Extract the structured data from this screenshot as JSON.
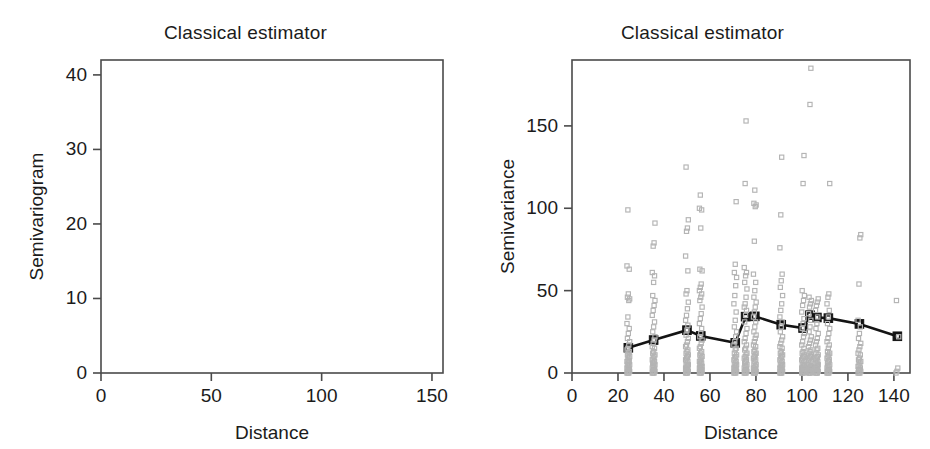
{
  "figure": {
    "background_color": "#ffffff",
    "foreground_color": "#1b1b1b",
    "cloud_color": "#b4b4b4",
    "mean_color": "#141414",
    "axis_color": "#4a4a4a"
  },
  "panels": {
    "left": {
      "title": "Classical estimator",
      "xlabel": "Distance",
      "ylabel": "Semivariogram",
      "xticks": [
        "0",
        "50",
        "100",
        "150"
      ],
      "yticks": [
        "40",
        "30",
        "20",
        "10",
        "0"
      ]
    },
    "right": {
      "title": "Classical estimator",
      "xlabel": "Distance",
      "ylabel": "Semivariance",
      "xticks": [
        "0",
        "20",
        "40",
        "60",
        "80",
        "100",
        "120",
        "140"
      ],
      "yticks": [
        "150",
        "100",
        "50",
        "0"
      ]
    }
  },
  "chart_data": [
    {
      "id": "left-panel",
      "type": "scatter",
      "title": "Classical estimator",
      "xlabel": "Distance",
      "ylabel": "Semivariogram",
      "xlim": [
        0,
        155
      ],
      "ylim": [
        0,
        42
      ],
      "xticks": [
        0,
        50,
        100,
        150
      ],
      "yticks": [
        0,
        10,
        20,
        30,
        40
      ],
      "grid": false,
      "legend": "none",
      "marker": "open-circle",
      "series": [
        {
          "name": "Classical semivariogram estimate",
          "points": [
            {
              "x": 24.5,
              "y": 15.1
            },
            {
              "x": 35.5,
              "y": 19.6
            },
            {
              "x": 50.0,
              "y": 25.8
            },
            {
              "x": 56.0,
              "y": 22.1
            },
            {
              "x": 71.0,
              "y": 18.6
            },
            {
              "x": 75.5,
              "y": 34.0
            },
            {
              "x": 79.5,
              "y": 34.0
            },
            {
              "x": 91.0,
              "y": 29.5
            },
            {
              "x": 100.5,
              "y": 27.1
            },
            {
              "x": 103.5,
              "y": 34.8
            },
            {
              "x": 106.5,
              "y": 33.8
            },
            {
              "x": 111.5,
              "y": 33.2
            },
            {
              "x": 125.0,
              "y": 29.9
            },
            {
              "x": 141.5,
              "y": 22.3
            }
          ]
        }
      ]
    },
    {
      "id": "right-panel",
      "type": "scatter",
      "title": "Classical estimator",
      "xlabel": "Distance",
      "ylabel": "Semivariance",
      "xlim": [
        0,
        147
      ],
      "ylim": [
        0,
        190
      ],
      "xticks": [
        0,
        20,
        40,
        60,
        80,
        100,
        120,
        140
      ],
      "yticks": [
        0,
        50,
        100,
        150
      ],
      "grid": false,
      "legend": "none",
      "series": [
        {
          "name": "Mean semivariance",
          "marker": "filled-square",
          "line": "solid-thick",
          "points": [
            {
              "x": 24.5,
              "y": 15.3
            },
            {
              "x": 35.5,
              "y": 20.0
            },
            {
              "x": 50.0,
              "y": 26.0
            },
            {
              "x": 56.0,
              "y": 22.5
            },
            {
              "x": 71.0,
              "y": 18.3
            },
            {
              "x": 75.5,
              "y": 34.2
            },
            {
              "x": 79.5,
              "y": 34.4
            },
            {
              "x": 91.0,
              "y": 29.3
            },
            {
              "x": 100.5,
              "y": 27.3
            },
            {
              "x": 103.5,
              "y": 35.1
            },
            {
              "x": 106.5,
              "y": 33.7
            },
            {
              "x": 111.5,
              "y": 33.3
            },
            {
              "x": 125.0,
              "y": 29.8
            },
            {
              "x": 141.5,
              "y": 22.3
            }
          ]
        },
        {
          "name": "Variogram cloud",
          "marker": "open-square",
          "note": "Individual pairwise semivariances plotted as vertical columns at each lag distance.",
          "columns": [
            {
              "x": 24.5,
              "values": [
                0,
                0,
                0,
                1,
                1,
                2,
                2,
                3,
                3,
                4,
                5,
                5,
                6,
                7,
                7,
                8,
                9,
                10,
                11,
                12,
                13,
                14,
                15,
                17,
                19,
                21,
                24,
                27,
                30,
                34,
                44,
                45,
                46,
                48,
                63,
                65,
                99
              ]
            },
            {
              "x": 35.5,
              "values": [
                0,
                0,
                0,
                1,
                1,
                2,
                2,
                3,
                4,
                4,
                5,
                6,
                6,
                7,
                8,
                9,
                10,
                11,
                12,
                13,
                15,
                16,
                18,
                20,
                22,
                25,
                28,
                31,
                35,
                38,
                41,
                44,
                47,
                55,
                59,
                61,
                77,
                79,
                91
              ]
            },
            {
              "x": 50.0,
              "values": [
                0,
                0,
                0,
                1,
                1,
                2,
                2,
                3,
                3,
                4,
                5,
                5,
                6,
                7,
                8,
                9,
                10,
                11,
                12,
                13,
                14,
                16,
                17,
                19,
                21,
                23,
                26,
                29,
                32,
                35,
                39,
                43,
                48,
                50,
                62,
                71,
                86,
                88,
                93,
                125
              ]
            },
            {
              "x": 56.0,
              "values": [
                0,
                0,
                0,
                1,
                1,
                2,
                2,
                3,
                3,
                4,
                4,
                5,
                6,
                6,
                7,
                8,
                9,
                10,
                11,
                12,
                13,
                15,
                16,
                18,
                20,
                22,
                24,
                27,
                30,
                33,
                36,
                40,
                44,
                46,
                48,
                50,
                52,
                54,
                62,
                63,
                88,
                99,
                100,
                108
              ]
            },
            {
              "x": 71.0,
              "values": [
                0,
                0,
                0,
                1,
                1,
                2,
                2,
                3,
                3,
                4,
                5,
                5,
                6,
                7,
                8,
                9,
                10,
                11,
                12,
                14,
                15,
                17,
                19,
                22,
                25,
                28,
                32,
                37,
                42,
                47,
                53,
                58,
                61,
                66,
                104
              ]
            },
            {
              "x": 75.5,
              "values": [
                0,
                0,
                0,
                1,
                1,
                2,
                2,
                3,
                4,
                4,
                5,
                6,
                7,
                8,
                9,
                10,
                11,
                12,
                14,
                15,
                17,
                19,
                21,
                24,
                27,
                31,
                35,
                38,
                40,
                42,
                46,
                51,
                55,
                59,
                61,
                64,
                115,
                153
              ]
            },
            {
              "x": 79.5,
              "values": [
                0,
                0,
                0,
                1,
                1,
                2,
                2,
                3,
                3,
                4,
                5,
                6,
                7,
                8,
                9,
                10,
                11,
                12,
                13,
                14,
                16,
                17,
                19,
                21,
                23,
                25,
                28,
                31,
                34,
                37,
                40,
                43,
                46,
                50,
                55,
                60,
                80,
                101,
                102,
                103,
                111
              ]
            },
            {
              "x": 91.0,
              "values": [
                0,
                0,
                0,
                1,
                1,
                2,
                2,
                3,
                3,
                4,
                5,
                5,
                6,
                7,
                8,
                9,
                10,
                11,
                12,
                13,
                15,
                16,
                18,
                20,
                22,
                25,
                28,
                31,
                34,
                38,
                42,
                47,
                52,
                56,
                60,
                76,
                96,
                131
              ]
            },
            {
              "x": 100.5,
              "values": [
                0,
                0,
                0,
                1,
                1,
                2,
                2,
                3,
                3,
                4,
                5,
                5,
                6,
                7,
                8,
                9,
                10,
                11,
                12,
                13,
                15,
                17,
                19,
                22,
                24,
                27,
                30,
                33,
                37,
                41,
                44,
                47,
                50,
                115,
                132
              ]
            },
            {
              "x": 103.5,
              "values": [
                0,
                0,
                0,
                1,
                1,
                2,
                2,
                3,
                3,
                4,
                4,
                5,
                6,
                7,
                8,
                9,
                10,
                11,
                12,
                13,
                14,
                16,
                18,
                20,
                22,
                25,
                28,
                32,
                36,
                40,
                42,
                44,
                46,
                163,
                185
              ]
            },
            {
              "x": 106.5,
              "values": [
                0,
                0,
                0,
                1,
                1,
                2,
                2,
                3,
                3,
                4,
                5,
                6,
                6,
                7,
                8,
                9,
                10,
                11,
                12,
                14,
                15,
                17,
                19,
                21,
                24,
                27,
                30,
                34,
                38,
                41,
                43,
                45
              ]
            },
            {
              "x": 111.5,
              "values": [
                0,
                0,
                0,
                1,
                1,
                2,
                2,
                3,
                4,
                4,
                5,
                6,
                7,
                8,
                9,
                10,
                11,
                12,
                13,
                15,
                17,
                19,
                21,
                24,
                27,
                30,
                34,
                38,
                42,
                46,
                48,
                115
              ]
            },
            {
              "x": 125.0,
              "values": [
                0,
                0,
                0,
                1,
                2,
                2,
                3,
                4,
                5,
                6,
                7,
                8,
                9,
                11,
                12,
                14,
                16,
                18,
                21,
                24,
                28,
                32,
                54,
                82,
                84
              ]
            },
            {
              "x": 141.5,
              "values": [
                0,
                1,
                3,
                22,
                44
              ]
            }
          ]
        }
      ]
    }
  ]
}
